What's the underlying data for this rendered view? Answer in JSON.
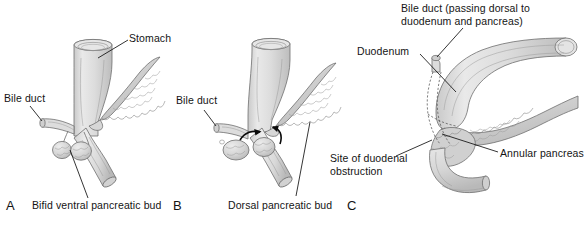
{
  "figure": {
    "type": "medical-illustration",
    "background_color": "#ffffff",
    "organ_fill": "#dcdcdc",
    "organ_outline": "#6f6f6f",
    "pancreas_fill": "#d2d2d2",
    "leader_line_color": "#111111",
    "arrow_color": "#0b0b0b"
  },
  "panels": [
    {
      "letter": "A",
      "caption": "Bifid ventral pancreatic bud",
      "labels": [
        {
          "text": "Stomach"
        },
        {
          "text": "Bile duct"
        },
        {
          "text": "Bifid ventral pancreatic bud"
        }
      ]
    },
    {
      "letter": "B",
      "caption": "Dorsal pancreatic bud",
      "labels": [
        {
          "text": "Bile duct"
        },
        {
          "text": "Dorsal pancreatic bud"
        }
      ],
      "annotations": [
        {
          "name": "rotation-arrow-left",
          "kind": "curved-arrow"
        },
        {
          "name": "rotation-arrow-right",
          "kind": "curved-arrow"
        }
      ]
    },
    {
      "letter": "C",
      "labels": [
        {
          "text": "Bile duct (passing dorsal to"
        },
        {
          "text": "duodenum and pancreas)"
        },
        {
          "text": "Duodenum"
        },
        {
          "text": "Site of duodenal"
        },
        {
          "text": "obstruction"
        },
        {
          "text": "Annular pancreas"
        }
      ]
    }
  ],
  "labels": {
    "a_stomach": "Stomach",
    "a_bile_duct": "Bile duct",
    "a_caption": "Bifid ventral pancreatic bud",
    "a_letter": "A",
    "b_bile_duct": "Bile duct",
    "b_caption": "Dorsal pancreatic bud",
    "b_letter": "B",
    "c_bile_duct_l1": "Bile duct (passing dorsal to",
    "c_bile_duct_l2": "duodenum and pancreas)",
    "c_duodenum": "Duodenum",
    "c_obstruction_l1": "Site of duodenal",
    "c_obstruction_l2": "obstruction",
    "c_annular": "Annular pancreas",
    "c_letter": "C"
  }
}
